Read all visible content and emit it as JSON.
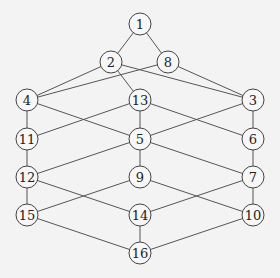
{
  "diagram": {
    "type": "hasse-diagram",
    "nodes": [
      {
        "id": "1",
        "label": "1",
        "x": 140,
        "y": 24
      },
      {
        "id": "2",
        "label": "2",
        "x": 111,
        "y": 62
      },
      {
        "id": "8",
        "label": "8",
        "x": 168,
        "y": 62
      },
      {
        "id": "4",
        "label": "4",
        "x": 27,
        "y": 100
      },
      {
        "id": "13",
        "label": "13",
        "x": 140,
        "y": 100
      },
      {
        "id": "3",
        "label": "3",
        "x": 253,
        "y": 100
      },
      {
        "id": "11",
        "label": "11",
        "x": 27,
        "y": 139
      },
      {
        "id": "5",
        "label": "5",
        "x": 140,
        "y": 139
      },
      {
        "id": "6",
        "label": "6",
        "x": 253,
        "y": 139
      },
      {
        "id": "12",
        "label": "12",
        "x": 27,
        "y": 177
      },
      {
        "id": "9",
        "label": "9",
        "x": 140,
        "y": 177
      },
      {
        "id": "7",
        "label": "7",
        "x": 253,
        "y": 177
      },
      {
        "id": "15",
        "label": "15",
        "x": 27,
        "y": 215
      },
      {
        "id": "14",
        "label": "14",
        "x": 140,
        "y": 215
      },
      {
        "id": "10",
        "label": "10",
        "x": 253,
        "y": 215
      },
      {
        "id": "16",
        "label": "16",
        "x": 140,
        "y": 253
      }
    ],
    "edges": [
      [
        "1",
        "2"
      ],
      [
        "1",
        "8"
      ],
      [
        "2",
        "4"
      ],
      [
        "2",
        "13"
      ],
      [
        "2",
        "3"
      ],
      [
        "8",
        "4"
      ],
      [
        "8",
        "3"
      ],
      [
        "4",
        "11"
      ],
      [
        "4",
        "5"
      ],
      [
        "13",
        "11"
      ],
      [
        "13",
        "5"
      ],
      [
        "13",
        "6"
      ],
      [
        "3",
        "5"
      ],
      [
        "3",
        "6"
      ],
      [
        "11",
        "12"
      ],
      [
        "5",
        "12"
      ],
      [
        "5",
        "9"
      ],
      [
        "5",
        "7"
      ],
      [
        "6",
        "7"
      ],
      [
        "12",
        "15"
      ],
      [
        "12",
        "14"
      ],
      [
        "9",
        "15"
      ],
      [
        "9",
        "10"
      ],
      [
        "7",
        "14"
      ],
      [
        "7",
        "10"
      ],
      [
        "15",
        "16"
      ],
      [
        "14",
        "16"
      ],
      [
        "10",
        "16"
      ]
    ],
    "node_radius": 11
  }
}
